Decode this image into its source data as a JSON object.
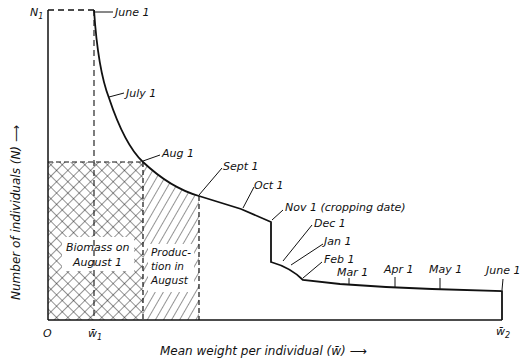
{
  "diagram": {
    "type": "cohort-production-diagram",
    "x_axis": {
      "title": "Mean weight per individual (w̄) ⟶",
      "origin_label": "O",
      "ticks": [
        {
          "label": "w̄",
          "subscript": "1"
        },
        {
          "label": "w̄",
          "subscript": "2"
        }
      ]
    },
    "y_axis": {
      "title": "Number of individuals (N) ⟶",
      "ticks": [
        {
          "label": "N",
          "subscript": "1"
        }
      ]
    },
    "curve_points": [
      {
        "label": "June 1"
      },
      {
        "label": "July 1"
      },
      {
        "label": "Aug 1"
      },
      {
        "label": "Sept 1"
      },
      {
        "label": "Oct 1"
      },
      {
        "label": "Nov 1 (cropping date)"
      },
      {
        "label": "Dec 1"
      },
      {
        "label": "Jan 1"
      },
      {
        "label": "Feb 1"
      },
      {
        "label": "Mar 1"
      },
      {
        "label": "Apr 1"
      },
      {
        "label": "May 1"
      },
      {
        "label": "June 1"
      }
    ],
    "regions": [
      {
        "name": "biomass",
        "line1": "Biomass on",
        "line2": "August 1",
        "fill": "cross-hatch"
      },
      {
        "name": "production",
        "line1": "Produc-",
        "line2": "tion in",
        "line3": "August",
        "fill": "diagonal-hatch"
      }
    ]
  }
}
